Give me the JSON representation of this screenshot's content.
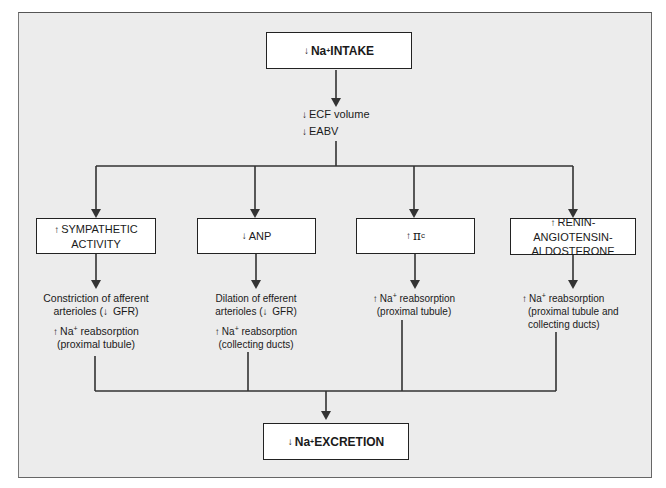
{
  "diagram": {
    "top_box": {
      "arrow": "↓",
      "label": "Na",
      "sup": "+",
      "label2": " INTAKE"
    },
    "intermediate": [
      {
        "arrow": "↓",
        "label": "ECF volume"
      },
      {
        "arrow": "↓",
        "label": "EABV"
      }
    ],
    "branches": [
      {
        "box": {
          "arrow": "↑",
          "line1": "SYMPATHETIC",
          "line2": "ACTIVITY"
        },
        "effects": [
          {
            "line1": "Constriction of afferent",
            "line2_pre": "arterioles (",
            "line2_arrow": "↓",
            "line2_post": " GFR)"
          },
          {
            "arrow": "↑",
            "line1_pre": "Na",
            "sup": "+",
            "line1_post": " reabsorption",
            "line2": "(proximal tubule)"
          }
        ]
      },
      {
        "box": {
          "arrow": "↓",
          "line1": "ANP"
        },
        "effects": [
          {
            "line1": "Dilation of efferent",
            "line2_pre": "arterioles (",
            "line2_arrow": "↓",
            "line2_post": " GFR)"
          },
          {
            "arrow": "↑",
            "line1_pre": "Na",
            "sup": "+",
            "line1_post": " reabsorption",
            "line2": "(collecting ducts)"
          }
        ]
      },
      {
        "box": {
          "arrow": "↑",
          "symbol": "π",
          "sub": "c"
        },
        "effects": [
          {
            "arrow": "↑",
            "line1_pre": "Na",
            "sup": "+",
            "line1_post": " reabsorption",
            "line2": "(proximal tubule)"
          }
        ]
      },
      {
        "box": {
          "arrow": "↑",
          "line1": "RENIN-ANGIOTENSIN-",
          "line2": "ALDOSTERONE"
        },
        "effects": [
          {
            "arrow": "↑",
            "line1_pre": "Na",
            "sup": "+",
            "line1_post": " reabsorption",
            "line2": "(proximal tubule and",
            "line3": "collecting ducts)"
          }
        ]
      }
    ],
    "bottom_box": {
      "arrow": "↓",
      "label": "Na",
      "sup": "+",
      "label2": " EXCRETION"
    }
  },
  "colors": {
    "panel_bg": "#ececec",
    "box_bg": "#ffffff",
    "line": "#333333"
  }
}
